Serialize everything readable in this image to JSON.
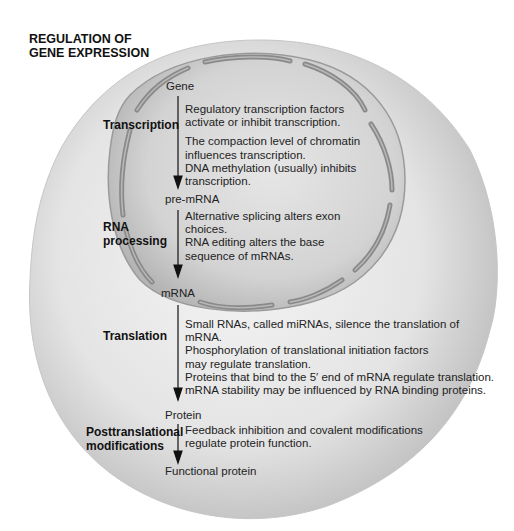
{
  "title": {
    "line1": "REGULATION OF",
    "line2": "GENE EXPRESSION"
  },
  "colors": {
    "cell_fill": "#dcdcdc",
    "cell_edge": "#bdbdbd",
    "nucleus_fill": "#c9c9c9",
    "nuclear_envelope": "#8e8e8e",
    "text": "#1c1c1c",
    "arrow": "#111111"
  },
  "nodes": {
    "gene": "Gene",
    "pre_mrna": "pre-mRNA",
    "mrna": "mRNA",
    "protein": "Protein",
    "functional_protein": "Functional protein"
  },
  "stages": [
    {
      "label_lines": [
        "Transcription"
      ],
      "descriptions": [
        "Regulatory transcription factors",
        "activate or inhibit transcription.",
        "The compaction level of chromatin",
        "influences transcription.",
        "DNA methylation (usually) inhibits",
        "transcription."
      ]
    },
    {
      "label_lines": [
        "RNA",
        "processing"
      ],
      "descriptions": [
        "Alternative splicing alters exon",
        "choices.",
        "RNA editing alters the base",
        "sequence of mRNAs."
      ]
    },
    {
      "label_lines": [
        "Translation"
      ],
      "descriptions": [
        "Small RNAs, called miRNAs, silence the translation of",
        "mRNA.",
        "Phosphorylation of translational initiation factors",
        "may regulate translation.",
        "Proteins that bind to the 5′ end of mRNA regulate translation.",
        "mRNA stability may be influenced by RNA binding proteins."
      ]
    },
    {
      "label_lines": [
        "Posttranslational",
        "modifications"
      ],
      "descriptions": [
        "Feedback inhibition and covalent modifications",
        "regulate protein function."
      ]
    }
  ]
}
